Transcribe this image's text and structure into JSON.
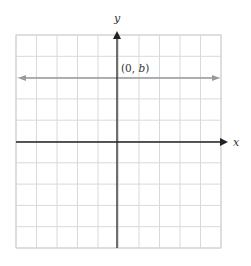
{
  "diagram": {
    "type": "coordinate-plane",
    "grid": {
      "columns": 10,
      "rows": 10,
      "left": 16,
      "top": 35,
      "right": 221,
      "bottom": 248,
      "color": "#d9d9d9"
    },
    "axes": {
      "x_label": "x",
      "y_label": "y",
      "origin_px": [
        117,
        142
      ],
      "color": "#222222"
    },
    "horizontal_line": {
      "equation": "y = b",
      "y_px": 78,
      "color": "#9a9a9a",
      "arrows": "both"
    },
    "point_label": {
      "text_open": "(0, ",
      "text_var": "b",
      "text_close": ")",
      "full": "(0, b)"
    }
  }
}
